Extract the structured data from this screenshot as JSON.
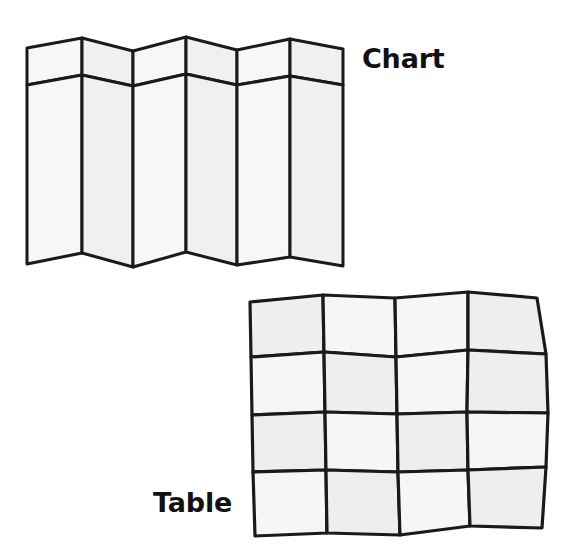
{
  "figure": {
    "background_color": "#ffffff",
    "stroke_color": "#1a1a1a",
    "panel_fill": "#f0f0f0",
    "cell_fill": "#eeeeee",
    "labels": {
      "chart": "Chart",
      "table": "Table"
    },
    "chart_diagram": {
      "name": "accordion-folded-chart",
      "panel_count": 6,
      "row_count": 2,
      "top_vertices_x": [
        27,
        82,
        133,
        186,
        237,
        290,
        343
      ],
      "top_vertices_y": [
        48,
        38,
        51,
        37,
        50,
        39,
        49
      ],
      "mid_vertices_y": [
        85,
        75,
        86,
        74,
        85,
        76,
        85
      ],
      "bottom_vertices_y": [
        264,
        253,
        267,
        252,
        265,
        257,
        266
      ]
    },
    "table_diagram": {
      "name": "warped-grid-table",
      "columns": 4,
      "rows": 4,
      "grid_points": [
        [
          [
            250,
            302
          ],
          [
            323,
            295
          ],
          [
            395,
            298
          ],
          [
            468,
            292
          ],
          [
            537,
            298
          ]
        ],
        [
          [
            251,
            357
          ],
          [
            324,
            352
          ],
          [
            396,
            357
          ],
          [
            468,
            350
          ],
          [
            546,
            354
          ]
        ],
        [
          [
            252,
            415
          ],
          [
            325,
            412
          ],
          [
            397,
            414
          ],
          [
            467,
            412
          ],
          [
            548,
            413
          ]
        ],
        [
          [
            253,
            472
          ],
          [
            326,
            470
          ],
          [
            398,
            472
          ],
          [
            468,
            470
          ],
          [
            546,
            467
          ]
        ],
        [
          [
            255,
            536
          ],
          [
            327,
            533
          ],
          [
            400,
            535
          ],
          [
            470,
            526
          ],
          [
            542,
            528
          ]
        ]
      ]
    }
  }
}
